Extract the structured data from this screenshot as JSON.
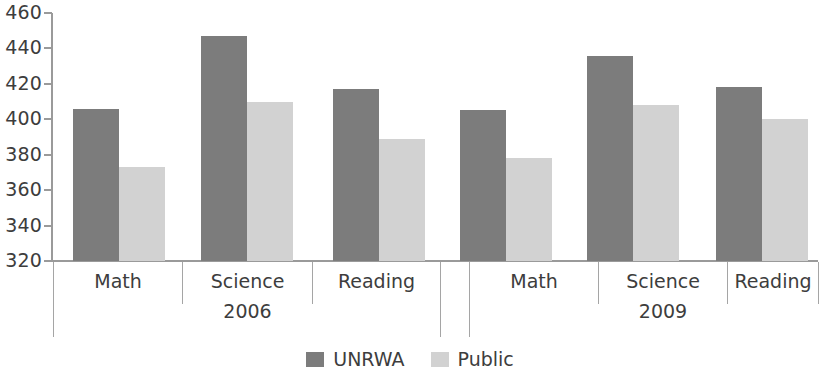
{
  "chart_data": {
    "type": "bar",
    "title": "",
    "subtitle": "",
    "xlabel": "",
    "ylabel": "",
    "ylim": [
      320,
      460
    ],
    "ytick_step": 20,
    "yticks": [
      460,
      440,
      420,
      400,
      380,
      360,
      340,
      320
    ],
    "grid": false,
    "legend_position": "bottom-center",
    "groups": [
      {
        "year": "2006",
        "categories": [
          "Math",
          "Science",
          "Reading"
        ]
      },
      {
        "year": "2009",
        "categories": [
          "Math",
          "Science",
          "Reading"
        ]
      }
    ],
    "categories": [
      "Math 2006",
      "Science 2006",
      "Reading 2006",
      "Math 2009",
      "Science 2009",
      "Reading 2009"
    ],
    "series": [
      {
        "name": "UNRWA",
        "color": "#7c7c7c",
        "values": [
          406,
          447,
          417,
          405,
          436,
          418
        ]
      },
      {
        "name": "Public",
        "color": "#d2d2d2",
        "values": [
          373,
          410,
          389,
          378,
          408,
          400
        ]
      }
    ]
  },
  "axis": {
    "y_tick_labels": [
      "460",
      "440",
      "420",
      "400",
      "380",
      "360",
      "340",
      "320"
    ]
  },
  "categories_display": {
    "g1c1": "Math",
    "g1c2": "Science",
    "g1c3": "Reading",
    "g2c1": "Math",
    "g2c2": "Science",
    "g2c3": "Reading",
    "year1": "2006",
    "year2": "2009"
  },
  "legend": {
    "items": [
      {
        "label": "UNRWA",
        "color": "#7c7c7c"
      },
      {
        "label": "Public",
        "color": "#d2d2d2"
      }
    ]
  }
}
